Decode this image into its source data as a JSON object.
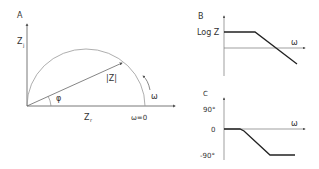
{
  "panels": {
    "a": {
      "letter": "A",
      "y_axis": "Z",
      "y_axis_sub": "j",
      "x_axis": "Z",
      "x_axis_sub": "r",
      "vector_label": "|Z|",
      "angle_label": "φ",
      "freq_label": "ω",
      "zero_freq_label": "ω=0"
    },
    "b": {
      "letter": "B",
      "y_label": "Log Z",
      "x_label": "ω"
    },
    "c": {
      "letter": "C",
      "tick_top": "90°",
      "tick_zero": "0",
      "tick_bottom": "-90°",
      "x_label": "ω"
    }
  },
  "colors": {
    "axis": "#555555",
    "curve": "#222222",
    "arc": "#999999"
  }
}
